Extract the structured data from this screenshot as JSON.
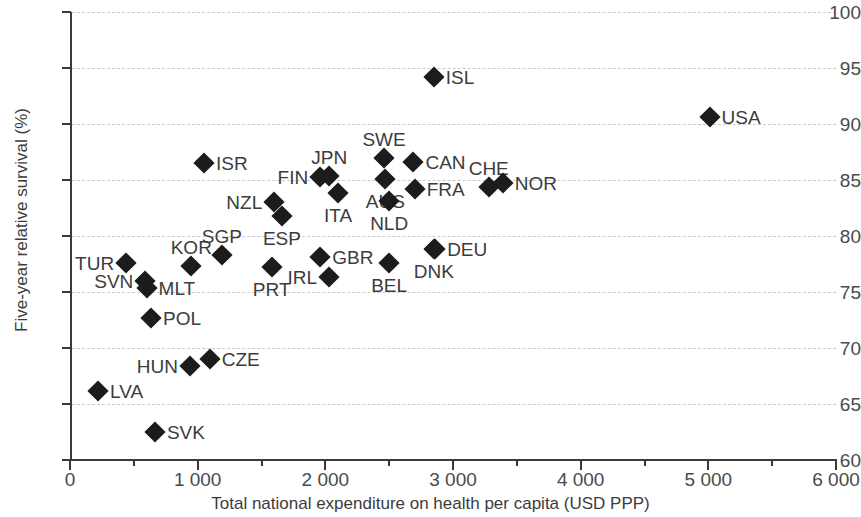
{
  "chart_data": {
    "type": "scatter",
    "title": "",
    "xlabel": "Total national expenditure on health per capita (USD PPP)",
    "ylabel": "Five-year relative survival (%)",
    "xlim": [
      0,
      6000
    ],
    "ylim": [
      60,
      100
    ],
    "xticks": [
      0,
      1000,
      2000,
      3000,
      4000,
      5000,
      6000
    ],
    "xtick_labels": [
      "0",
      "1 000",
      "2 000",
      "3 000",
      "4 000",
      "5 000",
      "6 000"
    ],
    "xtick_minor": [
      500,
      1500,
      2500,
      3500,
      4500,
      5500
    ],
    "yticks": [
      60,
      65,
      70,
      75,
      80,
      85,
      90,
      95,
      100
    ],
    "ytick_labels": [
      "60",
      "65",
      "70",
      "75",
      "80",
      "85",
      "90",
      "95",
      "100"
    ],
    "grid": "horizontal-dashed",
    "legend": "none",
    "marker": "diamond",
    "marker_color": "#1c1c1c",
    "points": [
      {
        "label": "LVA",
        "x": 220,
        "y": 66.2,
        "label_pos": "right"
      },
      {
        "label": "TUR",
        "x": 440,
        "y": 77.6,
        "label_pos": "left"
      },
      {
        "label": "SVN",
        "x": 590,
        "y": 76.0,
        "label_pos": "left"
      },
      {
        "label": "MLT",
        "x": 600,
        "y": 75.4,
        "label_pos": "right"
      },
      {
        "label": "POL",
        "x": 635,
        "y": 72.7,
        "label_pos": "right"
      },
      {
        "label": "SVK",
        "x": 665,
        "y": 62.5,
        "label_pos": "right"
      },
      {
        "label": "HUN",
        "x": 940,
        "y": 68.4,
        "label_pos": "left"
      },
      {
        "label": "CZE",
        "x": 1095,
        "y": 69.0,
        "label_pos": "right"
      },
      {
        "label": "KOR",
        "x": 950,
        "y": 77.3,
        "label_pos": "above"
      },
      {
        "label": "ISR",
        "x": 1050,
        "y": 86.5,
        "label_pos": "right"
      },
      {
        "label": "SGP",
        "x": 1190,
        "y": 78.3,
        "label_pos": "above"
      },
      {
        "label": "PRT",
        "x": 1580,
        "y": 77.2,
        "label_pos": "below"
      },
      {
        "label": "NZL",
        "x": 1600,
        "y": 83.0,
        "label_pos": "left"
      },
      {
        "label": "ESP",
        "x": 1660,
        "y": 81.8,
        "label_pos": "below"
      },
      {
        "label": "FIN",
        "x": 1960,
        "y": 85.3,
        "label_pos": "left"
      },
      {
        "label": "JPN",
        "x": 2030,
        "y": 85.4,
        "label_pos": "above"
      },
      {
        "label": "GBR",
        "x": 1960,
        "y": 78.1,
        "label_pos": "right"
      },
      {
        "label": "IRL",
        "x": 2030,
        "y": 76.3,
        "label_pos": "left"
      },
      {
        "label": "ITA",
        "x": 2100,
        "y": 83.8,
        "label_pos": "below"
      },
      {
        "label": "SWE",
        "x": 2460,
        "y": 87.0,
        "label_pos": "above"
      },
      {
        "label": "AUS",
        "x": 2470,
        "y": 85.1,
        "label_pos": "below"
      },
      {
        "label": "NLD",
        "x": 2500,
        "y": 83.1,
        "label_pos": "below"
      },
      {
        "label": "BEL",
        "x": 2500,
        "y": 77.6,
        "label_pos": "below"
      },
      {
        "label": "CAN",
        "x": 2690,
        "y": 86.6,
        "label_pos": "right"
      },
      {
        "label": "FRA",
        "x": 2700,
        "y": 84.2,
        "label_pos": "right"
      },
      {
        "label": "DNK",
        "x": 2850,
        "y": 78.8,
        "label_pos": "below"
      },
      {
        "label": "DEU",
        "x": 2860,
        "y": 78.8,
        "label_pos": "right"
      },
      {
        "label": "ISL",
        "x": 2850,
        "y": 94.2,
        "label_pos": "right"
      },
      {
        "label": "CHE",
        "x": 3280,
        "y": 84.4,
        "label_pos": "above"
      },
      {
        "label": "NOR",
        "x": 3390,
        "y": 84.7,
        "label_pos": "right"
      },
      {
        "label": "USA",
        "x": 5010,
        "y": 90.6,
        "label_pos": "right"
      }
    ]
  }
}
